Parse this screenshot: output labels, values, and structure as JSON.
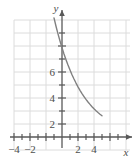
{
  "chart_data": {
    "type": "line",
    "title": "",
    "xlabel": "x",
    "ylabel": "y",
    "xlim": [
      -5,
      5.5
    ],
    "ylim": [
      -0.8,
      9.2
    ],
    "grid": true,
    "grid_spacing": 1,
    "legend": null,
    "x_ticks": [
      -4,
      -2,
      2,
      4
    ],
    "x_tick_labels": [
      "−4",
      "−2",
      "2",
      "4"
    ],
    "y_ticks": [
      2,
      4,
      6
    ],
    "y_tick_labels": [
      "2",
      "4",
      "6"
    ],
    "x_minor_ticks": [
      -5,
      -4,
      -3,
      -2,
      -1,
      1,
      2,
      3,
      4,
      5
    ],
    "y_minor_ticks": [
      1,
      2,
      3,
      4,
      5,
      6,
      7,
      8
    ],
    "series": [
      {
        "name": "exponential decay",
        "x": [
          -1.0,
          -0.75,
          -0.5,
          -0.25,
          0.0,
          0.25,
          0.5,
          0.75,
          1.0,
          1.25,
          1.5,
          1.75,
          2.0,
          2.25,
          2.5,
          2.75,
          3.0,
          3.25,
          3.5,
          3.75,
          4.0,
          4.25,
          4.5,
          4.75,
          5.0
        ],
        "y": [
          9.16,
          8.52,
          7.93,
          7.38,
          6.87,
          6.39,
          5.95,
          5.53,
          5.15,
          4.79,
          4.46,
          4.15,
          3.86,
          3.59,
          3.34,
          3.11,
          2.89,
          2.69,
          2.51,
          2.33,
          2.17,
          2.02,
          1.88,
          1.75,
          1.63
        ],
        "color": "#808080"
      }
    ]
  },
  "axes": {
    "x_axis_name": "x-axis",
    "y_axis_name": "y-axis",
    "x_label": "x",
    "y_label": "y",
    "axis_color": "#595959",
    "grid_color": "#d9d9d9"
  }
}
